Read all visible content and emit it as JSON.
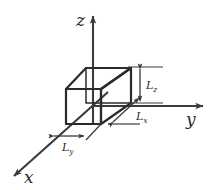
{
  "figure": {
    "background_color": "#ffffff",
    "line_color": "#3a3a3a",
    "box_edge_color": "#2b2b2b",
    "text_color": "#2b2b2b"
  },
  "axes": [
    {
      "id": "x",
      "label": "x",
      "sub": "",
      "direction": "down-left",
      "arrow": "true"
    },
    {
      "id": "y",
      "label": "y",
      "sub": "",
      "direction": "right",
      "arrow": "true"
    },
    {
      "id": "z",
      "label": "z",
      "sub": "",
      "direction": "up",
      "arrow": "true"
    }
  ],
  "dimensions": [
    {
      "id": "Lx",
      "label": "L",
      "sub": "x",
      "orientation": "diagonal",
      "arrow": "double-headed"
    },
    {
      "id": "Ly",
      "label": "L",
      "sub": "y",
      "orientation": "horizontal",
      "arrow": "double-headed"
    },
    {
      "id": "Lz",
      "label": "L",
      "sub": "z",
      "orientation": "vertical",
      "arrow": "double-headed"
    }
  ],
  "shape": {
    "type": "cuboid",
    "name": "rectangular box",
    "visible_faces": [
      "front",
      "top",
      "right"
    ]
  }
}
